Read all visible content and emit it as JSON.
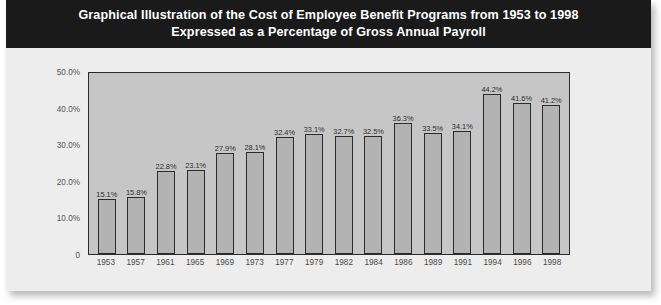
{
  "card": {
    "title_line_1": "Graphical Illustration of the Cost of Employee Benefit Programs from 1953 to 1998",
    "title_line_2": "Expressed as a Percentage of Gross Annual Payroll"
  },
  "colors": {
    "title_band": "#1a1a1a",
    "title_text": "#ffffff",
    "card_background": "#eeeeee",
    "plot_background": "#c6c6c6",
    "bar_fill": "#b3b3b3",
    "bar_outline": "#2b2b2b",
    "axis_text": "#555555"
  },
  "chart_data": {
    "type": "bar",
    "title": "Graphical Illustration of the Cost of Employee Benefit Programs from 1953 to 1998 Expressed as a Percentage of Gross Annual Payroll",
    "xlabel": "",
    "ylabel": "",
    "ylim": [
      0,
      50
    ],
    "grid": false,
    "legend": "none",
    "ytick_labels": [
      "50.0%",
      "40.0%",
      "30.0%",
      "20.0%",
      "10.0%",
      "0"
    ],
    "ytick_values": [
      50,
      40,
      30,
      20,
      10,
      0
    ],
    "categories": [
      "1953",
      "1957",
      "1961",
      "1965",
      "1969",
      "1973",
      "1977",
      "1979",
      "1982",
      "1984",
      "1986",
      "1989",
      "1991",
      "1994",
      "1996",
      "1998"
    ],
    "values": [
      15.1,
      15.8,
      22.8,
      23.1,
      27.9,
      28.1,
      32.4,
      33.1,
      32.7,
      32.5,
      36.3,
      33.5,
      34.1,
      44.2,
      41.6,
      41.2
    ],
    "data_labels": [
      "15.1%",
      "15.8%",
      "22.8%",
      "23.1%",
      "27.9%",
      "28.1%",
      "32.4%",
      "33.1%",
      "32.7%",
      "32.5%",
      "36.3%",
      "33.5%",
      "34.1%",
      "44.2%",
      "41.6%",
      "41.2%"
    ]
  }
}
